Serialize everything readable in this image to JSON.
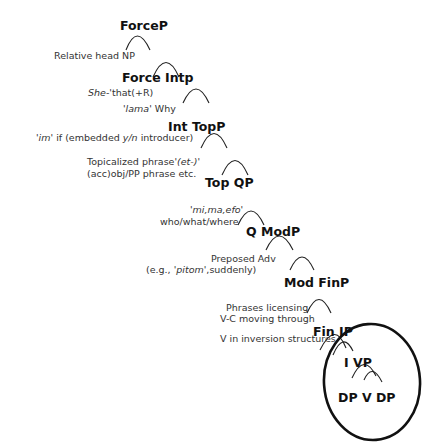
{
  "diagram": {
    "type": "syntax-tree",
    "nodes": {
      "forcep": "ForceP",
      "force_intp": "Force Intp",
      "int_topp": "Int TopP",
      "top_qp": "Top QP",
      "q_modp": "Q ModP",
      "mod_finp": "Mod FinP",
      "fin_ip": "Fin IP",
      "i_vp": "I VP",
      "dp_v_dp": "DP V DP"
    },
    "annotations": {
      "relative_head": "Relative head NP",
      "she_italic": "She",
      "she_rest": "-'that(+R)",
      "lama_italic": "'lama'",
      "lama_rest": " Why",
      "im_italic": "'im'",
      "im_mid": " if (embedded ",
      "im_yn": "y/n",
      "im_rest": " introducer)",
      "topic_line1_plain": "Topicalized phrase",
      "topic_line1_italic": "'(et-)'",
      "topic_line2": "(acc)obj/PP phrase etc.",
      "q_line1_italic": "'mi,ma,efo'",
      "q_line2": "who/what/where",
      "adv_line1": "Preposed Adv",
      "adv_line2_pre": "(e.g., ",
      "adv_line2_italic": "'pitom'",
      "adv_line2_post": ",suddenly)",
      "fin_line1": "Phrases licensing",
      "fin_line2": "V-C moving through",
      "fin_line3": "V in inversion structures"
    },
    "highlight": "ellipse around IP subtree"
  }
}
